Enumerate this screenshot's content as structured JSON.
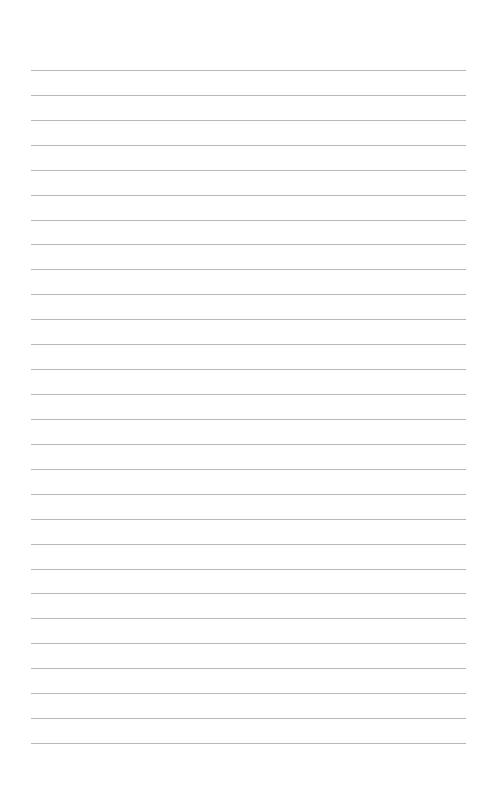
{
  "page": {
    "type": "lined-paper",
    "line_count": 28,
    "line_color": "#b8b8b8",
    "background_color": "#ffffff"
  }
}
